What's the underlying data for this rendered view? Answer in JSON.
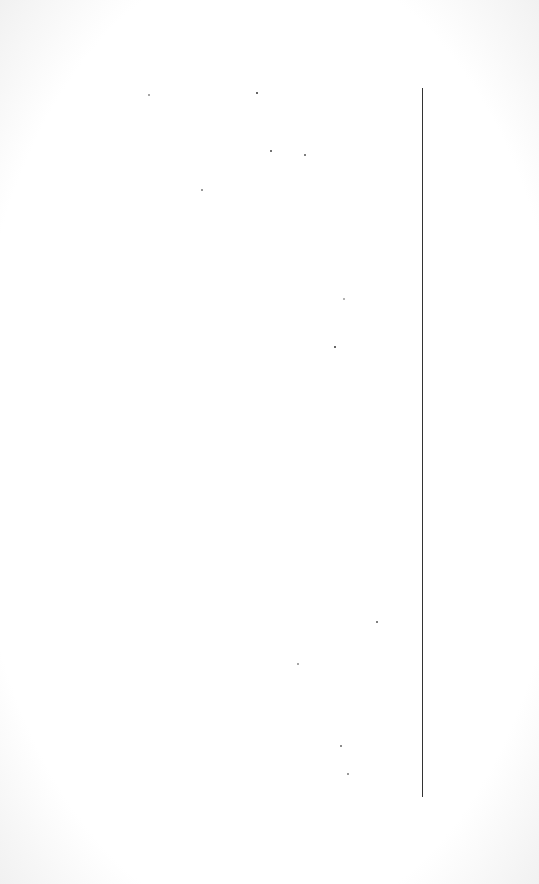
{
  "page": {
    "background": "#ffffff",
    "edge_tint": "#f1f1f1"
  },
  "vertical_rule": {
    "x": 422,
    "y_top": 88,
    "y_bottom": 797,
    "color": "#333333"
  },
  "specks": [
    {
      "x": 148,
      "y": 94,
      "color": "#888888"
    },
    {
      "x": 256,
      "y": 92,
      "color": "#333333"
    },
    {
      "x": 270,
      "y": 150,
      "color": "#444444"
    },
    {
      "x": 304,
      "y": 154,
      "color": "#555555"
    },
    {
      "x": 201,
      "y": 189,
      "color": "#777777"
    },
    {
      "x": 343,
      "y": 298,
      "color": "#999999"
    },
    {
      "x": 334,
      "y": 346,
      "color": "#333333"
    },
    {
      "x": 376,
      "y": 621,
      "color": "#555555"
    },
    {
      "x": 297,
      "y": 663,
      "color": "#888888"
    },
    {
      "x": 340,
      "y": 745,
      "color": "#666666"
    },
    {
      "x": 347,
      "y": 773,
      "color": "#777777"
    }
  ]
}
